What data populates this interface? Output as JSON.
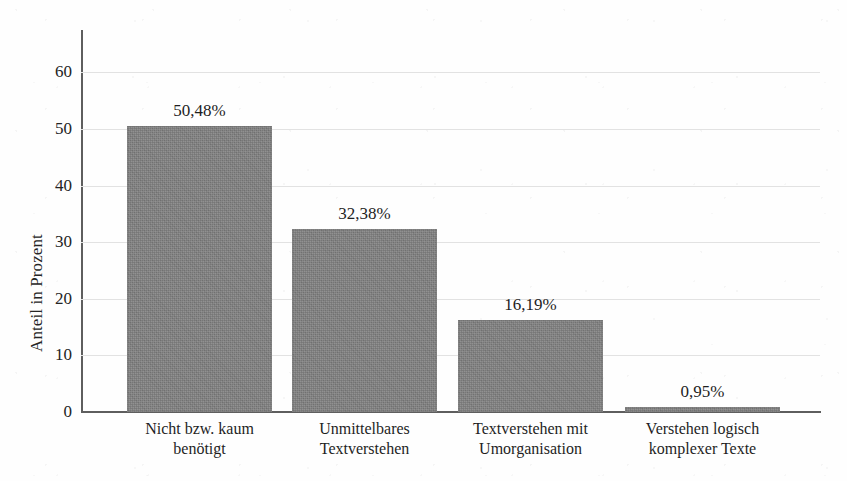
{
  "chart_data": {
    "type": "bar",
    "title": "",
    "xlabel": "",
    "ylabel": "Anteil in Prozent",
    "categories": [
      "Nicht bzw. kaum benötigt",
      "Unmittelbares Textverstehen",
      "Textverstehen mit Umorganisation",
      "Verstehen logisch komplexer Texte"
    ],
    "category_lines": [
      [
        "Nicht bzw. kaum",
        "benötigt"
      ],
      [
        "Unmittelbares",
        "Textverstehen"
      ],
      [
        "Textverstehen mit",
        "Umorganisation"
      ],
      [
        "Verstehen logisch",
        "komplexer Texte"
      ]
    ],
    "values": [
      50.48,
      32.38,
      16.19,
      0.95
    ],
    "value_labels": [
      "50,48%",
      "32,38%",
      "16,19%",
      "0,95%"
    ],
    "ylim": [
      0,
      65
    ],
    "yticks": [
      0,
      10,
      20,
      30,
      40,
      50,
      60
    ],
    "ytick_labels": [
      "0",
      "10",
      "20",
      "30",
      "40",
      "50",
      "60"
    ],
    "grid": true,
    "legend": false,
    "bar_color": "#818181",
    "axis_color": "#5e5e5e",
    "grid_color": "#e2e2e2",
    "background": "#fefefe"
  }
}
